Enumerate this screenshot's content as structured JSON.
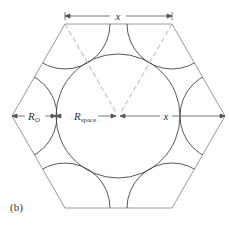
{
  "figure": {
    "panel_label": "(b)",
    "labels": {
      "top_dimension": "x",
      "r_o": "R",
      "r_o_sub": "O",
      "r_space": "R",
      "r_space_sub": "space",
      "right_dimension": "x"
    },
    "colors": {
      "hexagon": "#9a9a9a",
      "circles": "#444444",
      "dashed": "#aaaaaa",
      "arrows": "#555555"
    }
  }
}
